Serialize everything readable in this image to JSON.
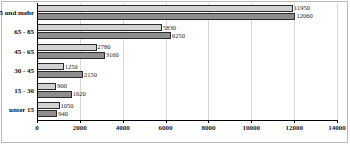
{
  "chart_data": {
    "type": "bar",
    "orientation": "horizontal",
    "title": "",
    "xlabel": "",
    "ylabel": "",
    "xlim": [
      0,
      14000
    ],
    "xticks": [
      0,
      2000,
      4000,
      6000,
      8000,
      10000,
      12000,
      14000
    ],
    "xtick_labels": [
      "0",
      "2000",
      "4000",
      "6000",
      "8000",
      "10000",
      "12000",
      "14000"
    ],
    "grid": true,
    "legend": "none",
    "categories": [
      "unter 15",
      "15 - 30",
      "30 - 45",
      "45 - 65",
      "65 - 85",
      "5 und mehr"
    ],
    "series": [
      {
        "name": "series-light",
        "color": "#d2d2d2",
        "values": [
          1050,
          900,
          1250,
          2780,
          5830,
          11950
        ],
        "labels": [
          "1050",
          "900",
          "1250",
          "2780",
          "5830",
          "11950"
        ]
      },
      {
        "name": "series-dark",
        "color": "#8e8e8e",
        "values": [
          940,
          1620,
          2150,
          3160,
          6250,
          12060
        ],
        "labels": [
          "940",
          "1620",
          "2150",
          "3160",
          "6250",
          "12060"
        ]
      }
    ]
  }
}
